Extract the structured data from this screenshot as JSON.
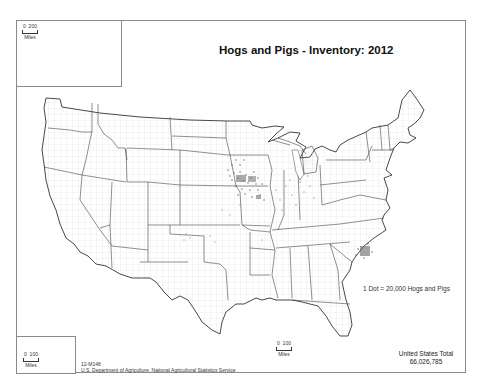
{
  "map": {
    "title": "Hogs and Pigs - Inventory:  2012",
    "legend": {
      "dot_value": "1 Dot = 20,000 Hogs and Pigs"
    },
    "total": {
      "label": "United States Total",
      "value": "66,026,785"
    },
    "credits": {
      "map_id": "12-M148",
      "source": "U.S. Department of Agriculture, National Agricultural Statistics Service"
    },
    "insets": {
      "alaska": {
        "scale_zero": "0",
        "scale_max": "200",
        "scale_unit": "Miles"
      },
      "hawaii": {
        "scale_zero": "0",
        "scale_max": "100",
        "scale_unit": "Miles"
      }
    },
    "main_scale": {
      "scale_zero": "0",
      "scale_max": "100",
      "scale_unit": "Miles"
    },
    "colors": {
      "border": "#8a8a8a",
      "state_line": "#333333",
      "county_line": "#c8c8c8",
      "dot": "#555555"
    }
  }
}
